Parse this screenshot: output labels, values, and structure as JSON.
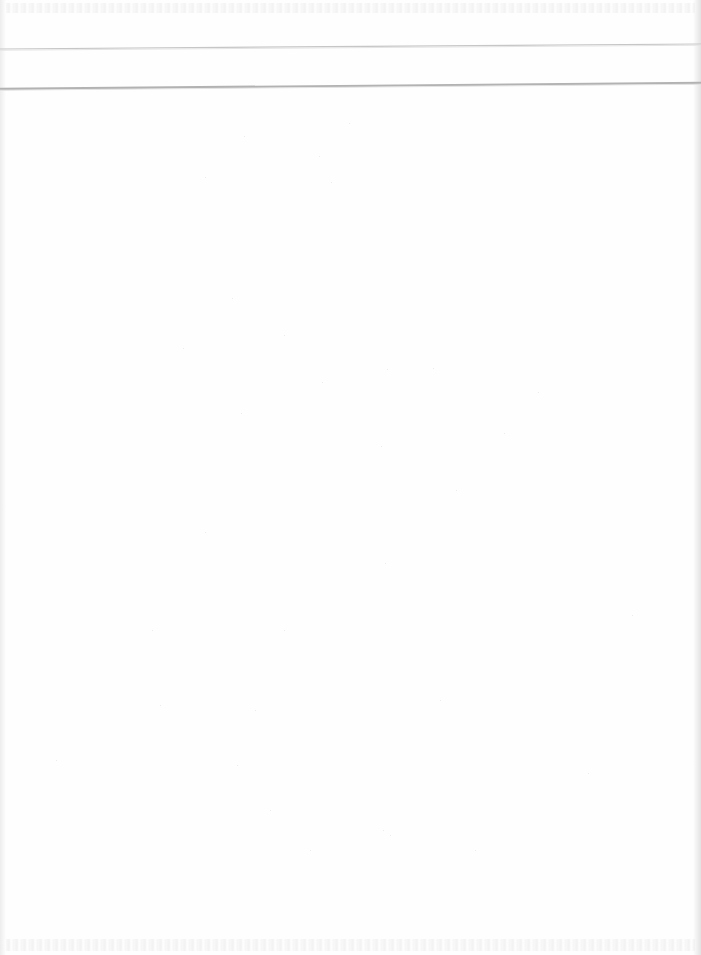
{
  "page": {
    "type": "scanned-blank-page",
    "background": "#fefefe",
    "text_content": []
  },
  "rules": [
    {
      "name": "upper-rule",
      "y_left": 49,
      "y_right": 44,
      "thickness": 1.2,
      "color": "#c6c6c6"
    },
    {
      "name": "lower-rule",
      "y_left": 89,
      "y_right": 83,
      "thickness": 2.4,
      "color": "#b2b2b2"
    }
  ],
  "bleed_through": {
    "top": {
      "legible": false
    },
    "bottom": {
      "legible": false
    }
  },
  "specks": [
    [
      244,
      136
    ],
    [
      349,
      123
    ],
    [
      319,
      156
    ],
    [
      205,
      177
    ],
    [
      331,
      182
    ],
    [
      232,
      298
    ],
    [
      183,
      348
    ],
    [
      284,
      335
    ],
    [
      387,
      369
    ],
    [
      433,
      368
    ],
    [
      322,
      382
    ],
    [
      241,
      413
    ],
    [
      381,
      446
    ],
    [
      538,
      392
    ],
    [
      504,
      433
    ],
    [
      456,
      490
    ],
    [
      205,
      532
    ],
    [
      152,
      630
    ],
    [
      385,
      563
    ],
    [
      284,
      630
    ],
    [
      255,
      710
    ],
    [
      160,
      705
    ],
    [
      56,
      760
    ],
    [
      270,
      810
    ],
    [
      237,
      765
    ],
    [
      440,
      700
    ],
    [
      310,
      850
    ],
    [
      390,
      835
    ],
    [
      383,
      830
    ],
    [
      475,
      850
    ],
    [
      632,
      615
    ],
    [
      588,
      773
    ]
  ]
}
